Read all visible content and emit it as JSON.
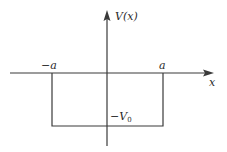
{
  "diagram": {
    "colors": {
      "line": "#3a3a3a",
      "text": "#2a2a2a",
      "background": "#ffffff"
    },
    "axes": {
      "x_label": "x",
      "y_label": "V(x)"
    },
    "labels": {
      "left_edge": "−a",
      "right_edge": "a",
      "depth": "−V",
      "depth_sub": "0"
    }
  }
}
